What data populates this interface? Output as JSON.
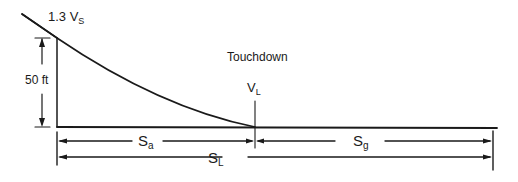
{
  "diagram": {
    "labels": {
      "initial_speed": "1.3 V",
      "initial_speed_sub": "S",
      "obstacle_height": "50 ft",
      "touchdown": "Touchdown",
      "landing_speed": "V",
      "landing_speed_sub": "L",
      "air_distance": "S",
      "air_distance_sub": "a",
      "ground_distance": "S",
      "ground_distance_sub": "g",
      "total_distance": "S",
      "total_distance_sub": "L"
    },
    "colors": {
      "line": "#1a1a1a",
      "background": "#ffffff"
    }
  }
}
